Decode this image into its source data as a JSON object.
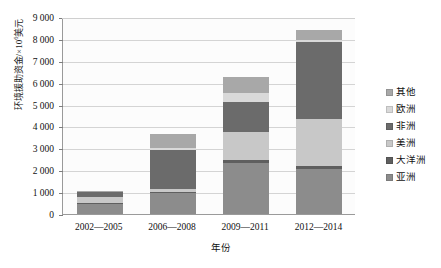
{
  "chart_data": {
    "type": "bar",
    "subtype": "stacked-bar",
    "title": "",
    "xlabel": "年份",
    "ylabel": "环境援助资金/×10⁶美元",
    "ylabel_base": "环境援助资金/×10",
    "ylabel_exp": "6",
    "ylabel_tail": "美元",
    "categories": [
      "2002—2005",
      "2006—2008",
      "2009—2011",
      "2012—2014"
    ],
    "ylim": [
      0,
      9000
    ],
    "ytick_values": [
      0,
      1000,
      2000,
      3000,
      4000,
      5000,
      6000,
      7000,
      8000,
      9000
    ],
    "ytick_labels": [
      "0",
      "1 000",
      "2 000",
      "3 000",
      "4 000",
      "5 000",
      "6 000",
      "7 000",
      "8 000",
      "9 000"
    ],
    "grid": true,
    "grid_axis": "y",
    "legend_position": "right",
    "stack_order_bottom_to_top": [
      "亚洲",
      "大洋洲",
      "美洲",
      "非洲",
      "欧洲",
      "其他"
    ],
    "series": [
      {
        "name": "亚洲",
        "color": "#8c8c8c",
        "values": [
          450,
          950,
          2350,
          2050
        ]
      },
      {
        "name": "大洋洲",
        "color": "#5f5f5f",
        "values": [
          60,
          50,
          100,
          130
        ]
      },
      {
        "name": "美洲",
        "color": "#c8c8c8",
        "values": [
          250,
          130,
          1300,
          2150
        ]
      },
      {
        "name": "非洲",
        "color": "#6b6b6b",
        "values": [
          230,
          1800,
          1350,
          3550
        ]
      },
      {
        "name": "欧洲",
        "color": "#d9d9d9",
        "values": [
          40,
          80,
          450,
          60
        ]
      },
      {
        "name": "其他",
        "color": "#a8a8a8",
        "values": [
          20,
          640,
          700,
          460
        ]
      }
    ],
    "totals": [
      1050,
      3650,
      6250,
      8400
    ]
  },
  "legend": {
    "items": [
      {
        "label": "其他",
        "color": "#a8a8a8"
      },
      {
        "label": "欧洲",
        "color": "#d9d9d9"
      },
      {
        "label": "非洲",
        "color": "#6b6b6b"
      },
      {
        "label": "美洲",
        "color": "#c8c8c8"
      },
      {
        "label": "大洋洲",
        "color": "#5f5f5f"
      },
      {
        "label": "亚洲",
        "color": "#8c8c8c"
      }
    ]
  },
  "colors": {
    "plot_background": "#fcfcfc",
    "gridline": "#d4d4d4",
    "axis": "#9a9a9a",
    "text": "#111111"
  }
}
